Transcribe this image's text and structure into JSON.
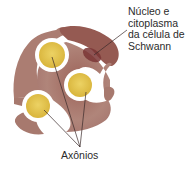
{
  "labels": {
    "nucleus_lines": [
      "Núcleo e",
      "citoplasma",
      "da célula de",
      "Schwann"
    ],
    "axons": "Axônios"
  },
  "colors": {
    "cytoplasm": "#a8766a",
    "cytoplasm_dark": "#8a4f48",
    "nucleus": "#7a3535",
    "axon_fill": "#e3c44a",
    "axon_ring": "#ffffff",
    "pointer_line": "#3a2a2a"
  }
}
